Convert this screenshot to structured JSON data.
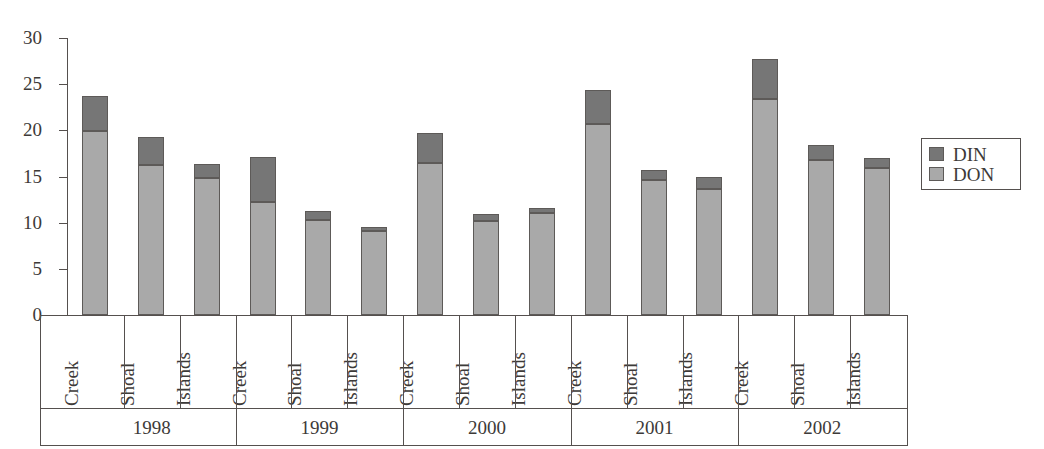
{
  "chart_data": {
    "type": "bar",
    "subtype": "stacked-bar-grouped",
    "title": "",
    "subtitle": "",
    "xlabel": "",
    "ylabel": "",
    "ylim": [
      0,
      30
    ],
    "ytick_values": [
      30,
      25,
      20,
      15,
      10,
      5,
      0
    ],
    "ytick_labels": [
      "30",
      "25",
      "20",
      "15",
      "10",
      "5",
      "0"
    ],
    "grid": false,
    "legend_position": "right",
    "colors": {
      "DIN": "#767676",
      "DON": "#a9a9a9",
      "outline": "#5d5a58",
      "axis": "#55504e",
      "text": "#3d3a38",
      "background": "#ffffff"
    },
    "series": [
      {
        "name": "DON",
        "values": [
          19.9,
          16.2,
          14.8,
          12.2,
          10.3,
          9.1,
          16.5,
          10.2,
          11.0,
          20.7,
          14.6,
          13.6,
          23.4,
          16.8,
          15.9
        ]
      },
      {
        "name": "DIN",
        "values": [
          3.8,
          3.1,
          1.6,
          4.9,
          1.0,
          0.4,
          3.2,
          0.7,
          0.6,
          3.7,
          1.1,
          1.3,
          4.3,
          1.6,
          1.1
        ]
      }
    ],
    "totals": [
      23.7,
      19.3,
      16.4,
      17.1,
      11.3,
      9.5,
      19.7,
      10.9,
      11.6,
      24.4,
      15.7,
      14.9,
      27.7,
      18.4,
      17.0
    ],
    "categories": [
      "Creek",
      "Shoal",
      "Islands",
      "Creek",
      "Shoal",
      "Islands",
      "Creek",
      "Shoal",
      "Islands",
      "Creek",
      "Shoal",
      "Islands",
      "Creek",
      "Shoal",
      "Islands"
    ],
    "groups": [
      {
        "label": "1998",
        "categories": [
          "Creek",
          "Shoal",
          "Islands"
        ]
      },
      {
        "label": "1999",
        "categories": [
          "Creek",
          "Shoal",
          "Islands"
        ]
      },
      {
        "label": "2000",
        "categories": [
          "Creek",
          "Shoal",
          "Islands"
        ]
      },
      {
        "label": "2001",
        "categories": [
          "Creek",
          "Shoal",
          "Islands"
        ]
      },
      {
        "label": "2002",
        "categories": [
          "Creek",
          "Shoal",
          "Islands"
        ]
      }
    ]
  },
  "legend": {
    "entries": [
      {
        "label": "DIN",
        "color": "#767676"
      },
      {
        "label": "DON",
        "color": "#a9a9a9"
      }
    ]
  },
  "axis": {
    "y": {
      "ticks": [
        {
          "value": 30,
          "label": "30"
        },
        {
          "value": 25,
          "label": "25"
        },
        {
          "value": 20,
          "label": "20"
        },
        {
          "value": 15,
          "label": "15"
        },
        {
          "value": 10,
          "label": "10"
        },
        {
          "value": 5,
          "label": "5"
        },
        {
          "value": 0,
          "label": "0"
        }
      ]
    }
  }
}
